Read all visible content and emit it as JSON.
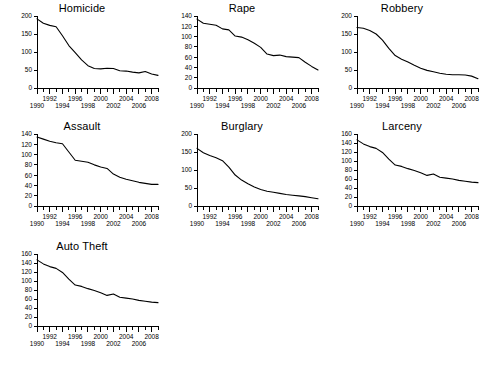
{
  "figure": {
    "background_color": "#ffffff",
    "line_color": "#000000",
    "layout": "small-multiples-grid",
    "columns": 3,
    "rows": 3,
    "panel_count": 7
  },
  "chart_data": [
    {
      "type": "line",
      "title": "Homicide",
      "xlabel": "",
      "ylabel": "",
      "xlim": [
        1990,
        2009
      ],
      "ylim": [
        0,
        200
      ],
      "yticks": [
        0,
        50,
        100,
        150,
        200
      ],
      "xticks": [
        1990,
        1992,
        1994,
        1996,
        1998,
        2000,
        2002,
        2004,
        2006,
        2008
      ],
      "grid": false,
      "legend": "none",
      "x": [
        1990,
        1991,
        1992,
        1993,
        1994,
        1995,
        1996,
        1997,
        1998,
        1999,
        2000,
        2001,
        2002,
        2003,
        2004,
        2005,
        2006,
        2007,
        2008,
        2009
      ],
      "values": [
        192,
        180,
        174,
        170,
        145,
        118,
        98,
        78,
        62,
        54,
        53,
        55,
        54,
        48,
        47,
        44,
        42,
        46,
        39,
        35
      ]
    },
    {
      "type": "line",
      "title": "Rape",
      "xlabel": "",
      "ylabel": "",
      "xlim": [
        1990,
        2009
      ],
      "ylim": [
        0,
        140
      ],
      "yticks": [
        0,
        20,
        40,
        60,
        80,
        100,
        120,
        140
      ],
      "xticks": [
        1990,
        1992,
        1994,
        1996,
        1998,
        2000,
        2002,
        2004,
        2006,
        2008
      ],
      "grid": false,
      "legend": "none",
      "x": [
        1990,
        1991,
        1992,
        1993,
        1994,
        1995,
        1996,
        1997,
        1998,
        1999,
        2000,
        2001,
        2002,
        2003,
        2004,
        2005,
        2006,
        2007,
        2008,
        2009
      ],
      "values": [
        134,
        126,
        124,
        122,
        115,
        113,
        101,
        99,
        94,
        87,
        79,
        66,
        63,
        64,
        61,
        60,
        59,
        50,
        42,
        35
      ]
    },
    {
      "type": "line",
      "title": "Robbery",
      "xlabel": "",
      "ylabel": "",
      "xlim": [
        1990,
        2009
      ],
      "ylim": [
        0,
        200
      ],
      "yticks": [
        0,
        50,
        100,
        150,
        200
      ],
      "xticks": [
        1990,
        1992,
        1994,
        1996,
        1998,
        2000,
        2002,
        2004,
        2006,
        2008
      ],
      "grid": false,
      "legend": "none",
      "x": [
        1990,
        1991,
        1992,
        1993,
        1994,
        1995,
        1996,
        1997,
        1998,
        1999,
        2000,
        2001,
        2002,
        2003,
        2004,
        2005,
        2006,
        2007,
        2008,
        2009
      ],
      "values": [
        168,
        166,
        160,
        150,
        133,
        110,
        90,
        80,
        72,
        63,
        55,
        49,
        45,
        41,
        38,
        37,
        37,
        36,
        33,
        26
      ]
    },
    {
      "type": "line",
      "title": "Assault",
      "xlabel": "",
      "ylabel": "",
      "xlim": [
        1990,
        2009
      ],
      "ylim": [
        0,
        140
      ],
      "yticks": [
        0,
        20,
        40,
        60,
        80,
        100,
        120,
        140
      ],
      "xticks": [
        1990,
        1992,
        1994,
        1996,
        1998,
        2000,
        2002,
        2004,
        2006,
        2008
      ],
      "grid": false,
      "legend": "none",
      "x": [
        1990,
        1991,
        1992,
        1993,
        1994,
        1995,
        1996,
        1997,
        1998,
        1999,
        2000,
        2001,
        2002,
        2003,
        2004,
        2005,
        2006,
        2007,
        2008,
        2009
      ],
      "values": [
        134,
        130,
        126,
        123,
        121,
        105,
        89,
        87,
        85,
        80,
        76,
        73,
        62,
        56,
        52,
        49,
        46,
        44,
        42,
        42
      ]
    },
    {
      "type": "line",
      "title": "Burglary",
      "xlabel": "",
      "ylabel": "",
      "xlim": [
        1990,
        2009
      ],
      "ylim": [
        0,
        200
      ],
      "yticks": [
        0,
        50,
        100,
        150,
        200
      ],
      "xticks": [
        1990,
        1992,
        1994,
        1996,
        1998,
        2000,
        2002,
        2004,
        2006,
        2008
      ],
      "grid": false,
      "legend": "none",
      "x": [
        1990,
        1991,
        1992,
        1993,
        1994,
        1995,
        1996,
        1997,
        1998,
        1999,
        2000,
        2001,
        2002,
        2003,
        2004,
        2005,
        2006,
        2007,
        2008,
        2009
      ],
      "values": [
        160,
        148,
        140,
        134,
        126,
        108,
        86,
        72,
        62,
        53,
        46,
        41,
        38,
        35,
        32,
        30,
        28,
        26,
        23,
        20
      ]
    },
    {
      "type": "line",
      "title": "Larceny",
      "xlabel": "",
      "ylabel": "",
      "xlim": [
        1990,
        2009
      ],
      "ylim": [
        0,
        160
      ],
      "yticks": [
        0,
        20,
        40,
        60,
        80,
        100,
        120,
        140,
        160
      ],
      "xticks": [
        1990,
        1992,
        1994,
        1996,
        1998,
        2000,
        2002,
        2004,
        2006,
        2008
      ],
      "grid": false,
      "legend": "none",
      "x": [
        1990,
        1991,
        1992,
        1993,
        1994,
        1995,
        1996,
        1997,
        1998,
        1999,
        2000,
        2001,
        2002,
        2003,
        2004,
        2005,
        2006,
        2007,
        2008,
        2009
      ],
      "values": [
        147,
        138,
        132,
        128,
        119,
        104,
        91,
        88,
        83,
        79,
        74,
        68,
        71,
        64,
        62,
        60,
        57,
        55,
        53,
        52
      ]
    },
    {
      "type": "line",
      "title": "Auto Theft",
      "xlabel": "",
      "ylabel": "",
      "xlim": [
        1990,
        2009
      ],
      "ylim": [
        0,
        160
      ],
      "yticks": [
        0,
        20,
        40,
        60,
        80,
        100,
        120,
        140,
        160
      ],
      "xticks": [
        1990,
        1992,
        1994,
        1996,
        1998,
        2000,
        2002,
        2004,
        2006,
        2008
      ],
      "grid": false,
      "legend": "none",
      "x": [
        1990,
        1991,
        1992,
        1993,
        1994,
        1995,
        1996,
        1997,
        1998,
        1999,
        2000,
        2001,
        2002,
        2003,
        2004,
        2005,
        2006,
        2007,
        2008,
        2009
      ],
      "values": [
        147,
        138,
        132,
        128,
        119,
        104,
        91,
        88,
        83,
        79,
        74,
        68,
        71,
        64,
        62,
        60,
        57,
        55,
        53,
        52
      ]
    }
  ]
}
